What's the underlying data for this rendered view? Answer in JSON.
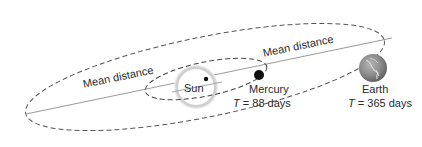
{
  "diagram": {
    "labels": {
      "mean_distance_left": "Mean distance",
      "mean_distance_right": "Mean distance",
      "sun": "Sun",
      "mercury": "Mercury",
      "mercury_period_symbol": "T",
      "mercury_period_value": " = 88 days",
      "earth": "Earth",
      "earth_period_symbol": "T",
      "earth_period_value": " = 365 days"
    },
    "icons": {
      "sun": "sun-glow-circle",
      "mercury": "mercury-dot",
      "earth": "earth-globe",
      "focus": "focus-dot"
    },
    "colors": {
      "orbit": "#555555",
      "axis": "#9a9a9a",
      "text": "#2a2a2a",
      "sun_glow": "#cfcfcf",
      "mercury": "#111111",
      "earth": "#8a8a8a"
    }
  }
}
